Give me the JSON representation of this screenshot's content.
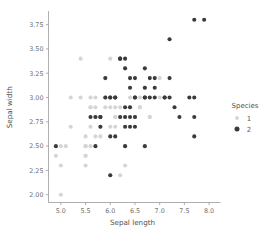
{
  "chart_data": {
    "type": "scatter",
    "title": "",
    "xlabel": "Sepal length",
    "ylabel": "Sepal width",
    "xlim": [
      4.75,
      8.15
    ],
    "ylim": [
      1.92,
      3.88
    ],
    "xticks": [
      "5.0",
      "5.5",
      "6.0",
      "6.5",
      "7.0",
      "7.5",
      "8.0"
    ],
    "xtick_values": [
      5.0,
      5.5,
      6.0,
      6.5,
      7.0,
      7.5,
      8.0
    ],
    "yticks": [
      "2.00",
      "2.25",
      "2.50",
      "2.75",
      "3.00",
      "3.25",
      "3.50",
      "3.75"
    ],
    "ytick_values": [
      2.0,
      2.25,
      2.5,
      2.75,
      3.0,
      3.25,
      3.5,
      3.75
    ],
    "grid": false,
    "legend": {
      "title": "Species",
      "position": "right",
      "entries": [
        {
          "label": "1",
          "color": "#d5d5d5"
        },
        {
          "label": "2",
          "color": "#3a3a3a"
        }
      ]
    },
    "series": [
      {
        "name": "1",
        "color": "#d5d5d5",
        "marker": "circle",
        "points": [
          [
            4.9,
            2.4
          ],
          [
            5.0,
            2.3
          ],
          [
            5.0,
            2.0
          ],
          [
            5.0,
            2.5
          ],
          [
            5.2,
            2.7
          ],
          [
            5.4,
            3.0
          ],
          [
            5.5,
            2.6
          ],
          [
            5.5,
            2.4
          ],
          [
            5.5,
            2.3
          ],
          [
            5.5,
            2.5
          ],
          [
            5.6,
            3.0
          ],
          [
            5.6,
            2.9
          ],
          [
            5.6,
            2.7
          ],
          [
            5.6,
            2.5
          ],
          [
            5.7,
            3.0
          ],
          [
            5.7,
            2.9
          ],
          [
            5.7,
            2.8
          ],
          [
            5.7,
            2.6
          ],
          [
            5.8,
            2.7
          ],
          [
            5.8,
            2.6
          ],
          [
            5.9,
            3.2
          ],
          [
            5.9,
            3.0
          ],
          [
            5.9,
            2.9
          ],
          [
            6.0,
            2.9
          ],
          [
            6.0,
            2.7
          ],
          [
            6.0,
            2.2
          ],
          [
            6.1,
            3.0
          ],
          [
            6.1,
            2.9
          ],
          [
            6.1,
            2.8
          ],
          [
            6.1,
            2.7
          ],
          [
            6.2,
            2.9
          ],
          [
            6.2,
            2.2
          ],
          [
            6.2,
            3.4
          ],
          [
            6.3,
            3.3
          ],
          [
            6.3,
            2.5
          ],
          [
            6.3,
            2.3
          ],
          [
            6.4,
            2.9
          ],
          [
            6.5,
            2.8
          ],
          [
            6.6,
            3.0
          ],
          [
            6.6,
            2.9
          ],
          [
            6.7,
            3.1
          ],
          [
            6.7,
            3.0
          ],
          [
            6.8,
            2.8
          ],
          [
            7.0,
            3.2
          ],
          [
            5.4,
            3.4
          ],
          [
            5.2,
            3.0
          ],
          [
            6.3,
            2.8
          ],
          [
            6.4,
            3.2
          ],
          [
            6.5,
            2.8
          ],
          [
            5.8,
            2.8
          ],
          [
            5.1,
            2.5
          ],
          [
            6.6,
            2.9
          ],
          [
            5.7,
            2.8
          ],
          [
            6.7,
            3.1
          ],
          [
            5.5,
            2.4
          ],
          [
            6.0,
            3.4
          ],
          [
            6.1,
            2.8
          ],
          [
            6.3,
            2.5
          ],
          [
            5.6,
            2.9
          ],
          [
            5.5,
            2.5
          ],
          [
            5.9,
            3.0
          ],
          [
            6.2,
            2.8
          ],
          [
            6.4,
            3.0
          ],
          [
            6.8,
            2.8
          ],
          [
            7.0,
            3.0
          ]
        ]
      },
      {
        "name": "2",
        "color": "#3a3a3a",
        "marker": "circle",
        "points": [
          [
            4.9,
            2.5
          ],
          [
            5.6,
            2.8
          ],
          [
            5.7,
            2.5
          ],
          [
            5.8,
            2.7
          ],
          [
            5.8,
            2.8
          ],
          [
            5.9,
            3.0
          ],
          [
            5.9,
            3.2
          ],
          [
            6.0,
            2.2
          ],
          [
            6.0,
            3.0
          ],
          [
            6.0,
            2.6
          ],
          [
            6.1,
            3.0
          ],
          [
            6.1,
            2.6
          ],
          [
            6.2,
            3.4
          ],
          [
            6.2,
            2.8
          ],
          [
            6.2,
            3.4
          ],
          [
            6.3,
            3.4
          ],
          [
            6.3,
            3.3
          ],
          [
            6.3,
            2.8
          ],
          [
            6.3,
            2.7
          ],
          [
            6.3,
            2.5
          ],
          [
            6.4,
            3.2
          ],
          [
            6.4,
            3.1
          ],
          [
            6.4,
            2.8
          ],
          [
            6.4,
            2.7
          ],
          [
            6.5,
            3.2
          ],
          [
            6.5,
            3.0
          ],
          [
            6.5,
            2.8
          ],
          [
            6.5,
            2.7
          ],
          [
            6.7,
            3.3
          ],
          [
            6.7,
            3.1
          ],
          [
            6.7,
            3.0
          ],
          [
            6.7,
            2.5
          ],
          [
            6.8,
            3.2
          ],
          [
            6.8,
            3.0
          ],
          [
            6.9,
            3.2
          ],
          [
            6.9,
            3.1
          ],
          [
            7.1,
            3.0
          ],
          [
            7.2,
            3.6
          ],
          [
            7.2,
            3.2
          ],
          [
            7.2,
            3.0
          ],
          [
            7.3,
            2.9
          ],
          [
            7.4,
            2.8
          ],
          [
            7.6,
            3.0
          ],
          [
            7.7,
            3.8
          ],
          [
            7.7,
            3.0
          ],
          [
            7.7,
            2.8
          ],
          [
            7.7,
            2.6
          ],
          [
            7.9,
            3.8
          ],
          [
            6.0,
            3.0
          ],
          [
            6.1,
            3.0
          ],
          [
            6.7,
            3.0
          ],
          [
            6.9,
            3.0
          ],
          [
            7.1,
            3.0
          ],
          [
            6.3,
            2.9
          ],
          [
            6.4,
            2.9
          ],
          [
            5.8,
            2.8
          ],
          [
            5.7,
            2.8
          ],
          [
            6.5,
            3.0
          ]
        ]
      }
    ]
  },
  "axes": {
    "x_label": "Sepal length",
    "y_label": "Sepal width"
  }
}
